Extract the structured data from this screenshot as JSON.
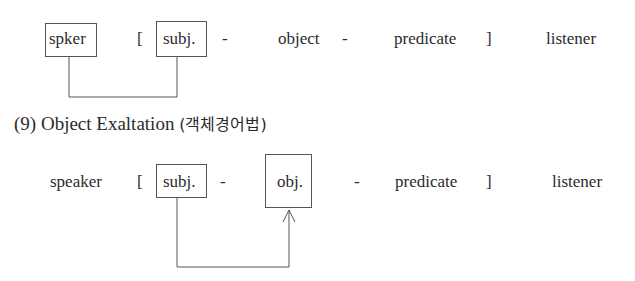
{
  "diagram_top": {
    "speaker_box": "spker",
    "open_bracket": "[",
    "subject_box": "subj.",
    "dash1": "-",
    "object": "object",
    "dash2": "-",
    "predicate": "predicate",
    "close_bracket": "]",
    "listener": "listener",
    "connector": "speaker-to-subject line"
  },
  "section": {
    "number": "(9)",
    "title": "Object Exaltation",
    "korean": "(객체경어법)"
  },
  "diagram_bottom": {
    "speaker": "speaker",
    "open_bracket": "[",
    "subject_box": "subj.",
    "dash1": "-",
    "object_box": "obj.",
    "dash2": "-",
    "predicate": "predicate",
    "close_bracket": "]",
    "listener": "listener",
    "connector": "subject-to-object arrow"
  }
}
